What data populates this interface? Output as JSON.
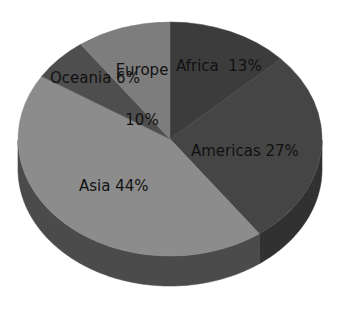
{
  "chart_data": {
    "type": "pie",
    "title": "",
    "subtitle": "",
    "xlabel": "",
    "ylabel": "",
    "categories": [
      "Africa",
      "Americas",
      "Asia",
      "Oceania",
      "Europe"
    ],
    "values": [
      13,
      27,
      44,
      6,
      10
    ],
    "unit": "%",
    "labels": [
      "Africa  13%",
      "Americas 27%",
      "Asia 44%",
      "Oceania 6%",
      "Europe\n10%"
    ],
    "slices": [
      {
        "name": "Africa",
        "value": 13,
        "label": "Africa  13%",
        "color": "#3c3c3c",
        "side_color": "#2a2a2a",
        "start_deg": 0,
        "end_deg": 46.8
      },
      {
        "name": "Americas",
        "value": 27,
        "label": "Americas 27%",
        "color": "#454545",
        "side_color": "#313131",
        "start_deg": 46.8,
        "end_deg": 144.0
      },
      {
        "name": "Asia",
        "value": 44,
        "label": "Asia 44%",
        "color": "#8c8c8c",
        "side_color": "#4b4b4b",
        "start_deg": 144.0,
        "end_deg": 302.4
      },
      {
        "name": "Oceania",
        "value": 6,
        "label": "Oceania 6%",
        "color": "#4e4e4e",
        "side_color": "#3a3a3a",
        "start_deg": 302.4,
        "end_deg": 324.0
      },
      {
        "name": "Europe",
        "value": 10,
        "label": "Europe 10%",
        "color": "#7d7d7d",
        "side_color": "#565656",
        "start_deg": 324.0,
        "end_deg": 360.0
      }
    ],
    "legend_position": "none",
    "grid": false,
    "three_d": true,
    "start_angle_deg": 0,
    "direction": "clockwise",
    "background_color": "#ffffff",
    "label_color": "#111111"
  },
  "labels": {
    "africa": "Africa  13%",
    "americas": "Americas 27%",
    "asia": "Asia 44%",
    "oceania": "Oceania 6%",
    "europe_line1": "Europe",
    "europe_line2": "10%"
  }
}
